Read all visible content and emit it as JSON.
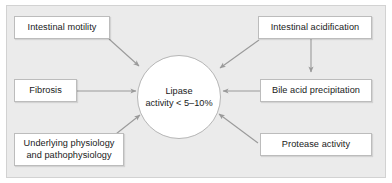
{
  "figure": {
    "background_color": "#ebebeb",
    "border_color": "#d2d2d2",
    "box_fill": "#ffffff",
    "box_border_color": "#bcbcbc",
    "arrow_color": "#9a9a9a",
    "text_color": "#1a1a1a"
  },
  "hub": {
    "label": "Lipase\nactivity < 5–10%",
    "shape": "circle"
  },
  "nodes": [
    {
      "id": "intestinal-motility",
      "label": "Intestinal motility"
    },
    {
      "id": "fibrosis",
      "label": "Fibrosis"
    },
    {
      "id": "underlying-physiology",
      "label": "Underlying physiology\nand pathophysiology"
    },
    {
      "id": "intestinal-acidification",
      "label": "Intestinal acidification"
    },
    {
      "id": "bile-acid-precipitation",
      "label": "Bile acid precipitation"
    },
    {
      "id": "protease-activity",
      "label": "Protease activity"
    }
  ],
  "edges": [
    {
      "id": "motility-to-hub",
      "from": "intestinal-motility",
      "to": "hub"
    },
    {
      "id": "fibrosis-to-hub",
      "from": "fibrosis",
      "to": "hub"
    },
    {
      "id": "physiology-to-hub",
      "from": "underlying-physiology",
      "to": "hub"
    },
    {
      "id": "acidification-to-hub",
      "from": "intestinal-acidification",
      "to": "hub"
    },
    {
      "id": "acidification-to-bile",
      "from": "intestinal-acidification",
      "to": "bile-acid-precipitation"
    },
    {
      "id": "bile-to-hub",
      "from": "bile-acid-precipitation",
      "to": "hub"
    },
    {
      "id": "protease-to-hub",
      "from": "protease-activity",
      "to": "hub"
    }
  ]
}
